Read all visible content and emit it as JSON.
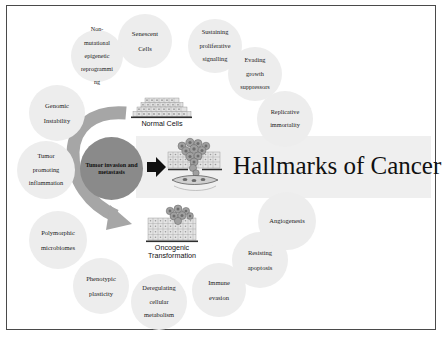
{
  "figure": {
    "title": "Hallmarks of Cancer",
    "core_label": "Tumor invasion and metastasis",
    "colors": {
      "background": "#ffffff",
      "frame_border": "#4a4a4a",
      "bubble_fill": "#ededed",
      "core_fill": "#8a8a8a",
      "band_fill": "#efefef",
      "arrow_curved": "#a6a6a6",
      "arrow_straight": "#111111",
      "text": "#1a1a1a"
    },
    "captions": [
      {
        "name": "normal-cells",
        "text": "Normal Cells"
      },
      {
        "name": "oncogenic-transformation",
        "line1": "Oncogenic",
        "line2": "Transformation"
      }
    ],
    "illustrations": [
      {
        "name": "normal-cells-illustration",
        "description": "stratified epithelial cell layers"
      },
      {
        "name": "invasion-illustration",
        "description": "tumor cells invading through basement membrane into blood vessel"
      },
      {
        "name": "oncogenic-illustration",
        "description": "tumor cells emerging from epithelial layer"
      }
    ],
    "arrows": [
      {
        "name": "curved-arrow",
        "from": "normal-cells",
        "to": "oncogenic-transformation"
      },
      {
        "name": "straight-arrow",
        "from": "core",
        "to": "invasion-illustration"
      }
    ],
    "hallmarks": [
      {
        "id": "senescent-cells",
        "lines": [
          "Senescent",
          "Cells"
        ]
      },
      {
        "id": "non-mutational-epigenetic",
        "lines": [
          "Non-",
          "mutational",
          "epigenetic",
          "reprogrammi",
          "ng"
        ]
      },
      {
        "id": "sustaining-proliferative",
        "lines": [
          "Sustaining",
          "proliferative",
          "signalling"
        ]
      },
      {
        "id": "evading-growth-suppressors",
        "lines": [
          "Evading",
          "growth",
          "suppressors"
        ]
      },
      {
        "id": "replicative-immortality",
        "lines": [
          "Replicative",
          "immortality"
        ]
      },
      {
        "id": "genomic-instability",
        "lines": [
          "Genomic",
          "Instability"
        ]
      },
      {
        "id": "tumor-promoting-inflammation",
        "lines": [
          "Tumor",
          "promoting",
          "inflammation"
        ]
      },
      {
        "id": "polymorphic-microbiomes",
        "lines": [
          "Polymorphic",
          "microbiomes"
        ]
      },
      {
        "id": "phenotypic-plasticity",
        "lines": [
          "Phenotypic",
          "plasticity"
        ]
      },
      {
        "id": "deregulating-cellular-metabolism",
        "lines": [
          "Deregulating",
          "cellular",
          "metabolism"
        ]
      },
      {
        "id": "immune-evasion",
        "lines": [
          "Immune",
          "evasion"
        ]
      },
      {
        "id": "resisting-apoptosis",
        "lines": [
          "Resisting",
          "apoptosis"
        ]
      },
      {
        "id": "angiogenesis",
        "lines": [
          "Angiogenesis"
        ]
      }
    ]
  }
}
